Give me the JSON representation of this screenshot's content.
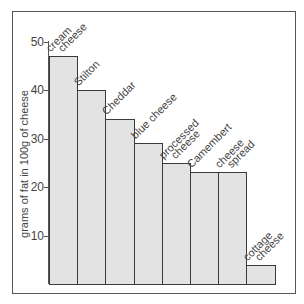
{
  "chart_data": {
    "type": "bar",
    "title": "",
    "xlabel": "",
    "ylabel": "grams of fat in 100g of cheese",
    "ylim": [
      0,
      50
    ],
    "yticks": [
      10,
      20,
      30,
      40,
      50
    ],
    "grid": false,
    "legend": null,
    "categories": [
      "cream cheese",
      "Stilton",
      "Cheddar",
      "blue cheese",
      "processed cheese",
      "Camembert",
      "cheese spread",
      "cottage cheese"
    ],
    "label_lines": [
      [
        "cream",
        "cheese"
      ],
      [
        "Stilton"
      ],
      [
        "Cheddar"
      ],
      [
        "blue cheese"
      ],
      [
        "processed",
        "cheese"
      ],
      [
        "Camembert"
      ],
      [
        "cheese",
        "spread"
      ],
      [
        "cottage",
        "cheese"
      ]
    ],
    "values": [
      47,
      40,
      34,
      29,
      25,
      23,
      23,
      4
    ],
    "colors": {
      "bar_fill": "#e3e3e3",
      "bar_border": "#3a3a3a",
      "axis": "#555555"
    }
  },
  "axis": {
    "ylabel": "grams of fat in 100g of cheese",
    "ticks": [
      "10",
      "20",
      "30",
      "40",
      "50"
    ]
  }
}
